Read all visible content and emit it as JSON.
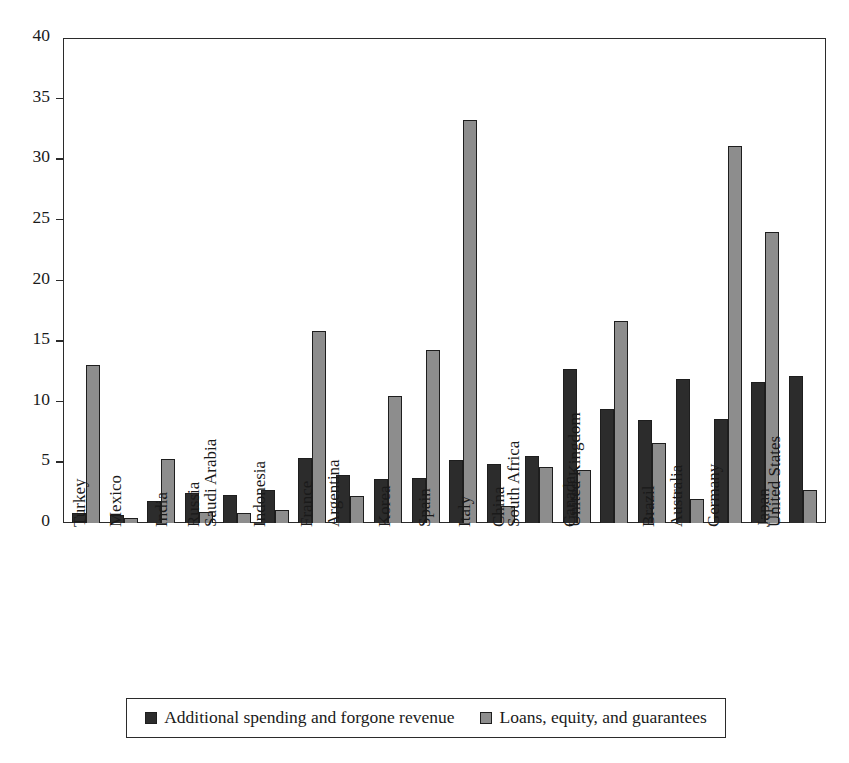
{
  "chart_data": {
    "type": "bar",
    "title": "",
    "subtitle": "",
    "xlabel": "",
    "ylabel": "",
    "ylim": [
      0,
      40
    ],
    "yticks": [
      0,
      5,
      10,
      15,
      20,
      25,
      30,
      35,
      40
    ],
    "ytick_labels": [
      "0",
      "5",
      "10",
      "15",
      "20",
      "25",
      "30",
      "35",
      "40"
    ],
    "grid": false,
    "legend_position": "bottom",
    "orientation": "vertical",
    "categories": [
      "Turkey",
      "Mexico",
      "India",
      "Russia",
      "Saudi Arabia",
      "Indonesia",
      "France",
      "Argentina",
      "Korea",
      "Spain",
      "Italy",
      "China",
      "South Africa",
      "Canada",
      "United Kingdom",
      "Brazil",
      "Australia",
      "Germany",
      "Japan",
      "United States"
    ],
    "series": [
      {
        "name": "Additional spending and forgone revenue",
        "color": "#2c2c2c",
        "values": [
          0.8,
          0.7,
          1.8,
          2.5,
          2.3,
          2.7,
          5.4,
          4.0,
          3.6,
          3.7,
          5.2,
          4.9,
          5.5,
          12.7,
          9.4,
          8.5,
          11.9,
          8.6,
          11.6,
          12.1
        ]
      },
      {
        "name": "Loans, equity, and guarantees",
        "color": "#8d8d8d",
        "values": [
          13.0,
          0.4,
          5.3,
          0.9,
          0.8,
          1.1,
          15.8,
          2.2,
          10.5,
          14.3,
          33.2,
          1.4,
          4.6,
          4.4,
          16.7,
          6.6,
          2.0,
          31.1,
          24.0,
          2.7
        ]
      }
    ]
  },
  "legend": {
    "items": [
      {
        "label": "Additional spending and forgone revenue"
      },
      {
        "label": "Loans, equity, and guarantees"
      }
    ]
  },
  "colors": {
    "series1": "#2c2c2c",
    "series2": "#8d8d8d",
    "axis": "#2b2b2b",
    "background": "#ffffff"
  }
}
